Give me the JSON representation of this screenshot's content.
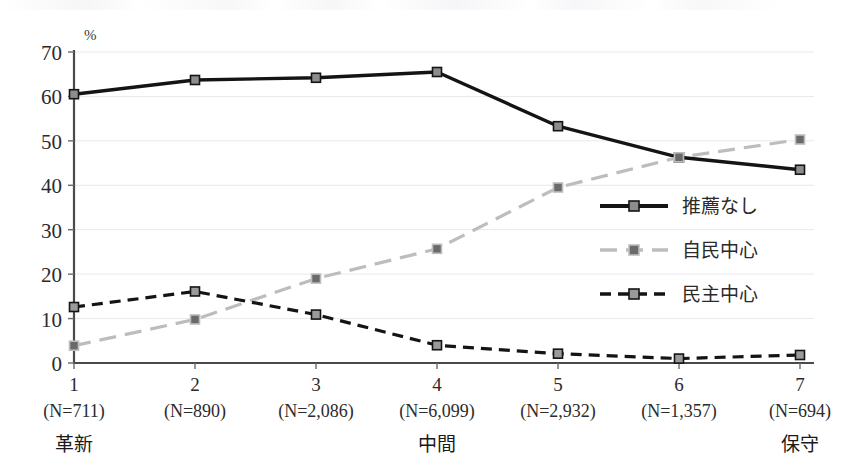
{
  "chart_data": {
    "type": "line",
    "title": "",
    "xlabel": "",
    "ylabel": "%",
    "ylim": [
      0,
      70
    ],
    "yticks": [
      0,
      10,
      20,
      30,
      40,
      50,
      60,
      70
    ],
    "grid": true,
    "legend_position": "inside-right",
    "categories": [
      "1",
      "2",
      "3",
      "4",
      "5",
      "6",
      "7"
    ],
    "category_counts": [
      "(N=711)",
      "(N=890)",
      "(N=2,086)",
      "(N=6,099)",
      "(N=2,932)",
      "(N=1,357)",
      "(N=694)"
    ],
    "axis_anchors": [
      {
        "at": "1",
        "label": "革新"
      },
      {
        "at": "4",
        "label": "中間"
      },
      {
        "at": "7",
        "label": "保守"
      }
    ],
    "series": [
      {
        "name": "推薦なし",
        "style": "solid",
        "color": "#141414",
        "marker": "square",
        "marker_fill": "#8d8d8d",
        "values": [
          60.5,
          63.7,
          64.2,
          65.5,
          53.3,
          46.3,
          43.5
        ]
      },
      {
        "name": "自民中心",
        "style": "dashed-long",
        "color": "#bdbdbd",
        "marker": "square",
        "marker_fill": "#6a6a6a",
        "values": [
          3.9,
          9.8,
          19.0,
          25.7,
          39.5,
          46.3,
          50.3
        ]
      },
      {
        "name": "民主中心",
        "style": "dashed-short",
        "color": "#141414",
        "marker": "square",
        "marker_fill": "#9a9a9a",
        "values": [
          12.6,
          16.1,
          10.9,
          4.0,
          2.1,
          1.0,
          1.8
        ]
      }
    ]
  },
  "axis": {
    "y_unit": "%",
    "y_tick_labels": [
      "70",
      "60",
      "50",
      "40",
      "30",
      "20",
      "10",
      "0"
    ]
  },
  "legend": {
    "items": [
      {
        "label": "推薦なし"
      },
      {
        "label": "自民中心"
      },
      {
        "label": "民主中心"
      }
    ]
  }
}
